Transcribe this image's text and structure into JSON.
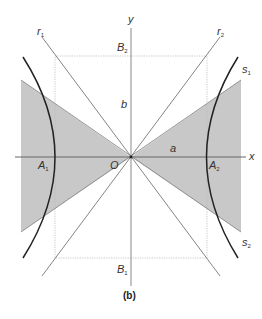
{
  "figure": {
    "caption": "(b)",
    "colors": {
      "shade": "#c8c8c8",
      "shade_edge": "#8a8a8a",
      "axis": "#666666",
      "asymptote": "#777777",
      "hyperbola": "#222222",
      "dotted": "#bbbbbb",
      "label": "#333333"
    }
  },
  "labels": {
    "x_axis": "x",
    "y_axis": "y",
    "origin": "O",
    "a": "a",
    "b": "b",
    "A1": {
      "main": "A",
      "sub": "1"
    },
    "A2": {
      "main": "A",
      "sub": "2"
    },
    "B1": {
      "main": "B",
      "sub": "1"
    },
    "B2": {
      "main": "B",
      "sub": "2"
    },
    "r1": {
      "main": "r",
      "sub": "1"
    },
    "r2": {
      "main": "r",
      "sub": "2"
    },
    "s1": {
      "main": "s",
      "sub": "1"
    },
    "s2": {
      "main": "s",
      "sub": "2"
    }
  }
}
